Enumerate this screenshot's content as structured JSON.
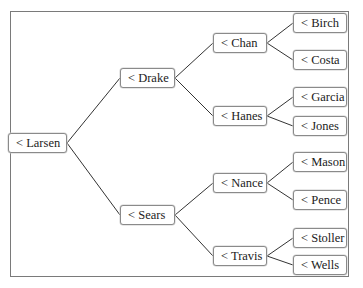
{
  "diagram": {
    "type": "tree",
    "orientation": "left-to-right",
    "root": "< Larsen",
    "nodes": {
      "larsen": {
        "label": "< Larsen",
        "x": 8,
        "y": 133,
        "w": 59
      },
      "drake": {
        "label": "< Drake",
        "x": 120,
        "y": 68,
        "w": 55
      },
      "sears": {
        "label": "< Sears",
        "x": 120,
        "y": 205,
        "w": 55
      },
      "chan": {
        "label": "< Chan",
        "x": 213,
        "y": 33,
        "w": 54
      },
      "hanes": {
        "label": "< Hanes",
        "x": 213,
        "y": 106,
        "w": 54
      },
      "nance": {
        "label": "< Nance",
        "x": 213,
        "y": 173,
        "w": 54
      },
      "travis": {
        "label": "< Travis",
        "x": 213,
        "y": 246,
        "w": 54
      },
      "birch": {
        "label": "< Birch",
        "x": 293,
        "y": 13,
        "w": 54
      },
      "costa": {
        "label": "< Costa",
        "x": 293,
        "y": 50,
        "w": 54
      },
      "garcia": {
        "label": "< Garcia",
        "x": 293,
        "y": 87,
        "w": 54
      },
      "jones": {
        "label": "< Jones",
        "x": 293,
        "y": 116,
        "w": 54
      },
      "mason": {
        "label": "< Mason",
        "x": 293,
        "y": 152,
        "w": 54
      },
      "pence": {
        "label": "< Pence",
        "x": 293,
        "y": 190,
        "w": 54
      },
      "stoller": {
        "label": "< Stoller",
        "x": 293,
        "y": 228,
        "w": 54
      },
      "wells": {
        "label": "< Wells",
        "x": 293,
        "y": 255,
        "w": 54
      }
    },
    "edges": [
      [
        "larsen",
        "drake"
      ],
      [
        "larsen",
        "sears"
      ],
      [
        "drake",
        "chan"
      ],
      [
        "drake",
        "hanes"
      ],
      [
        "sears",
        "nance"
      ],
      [
        "sears",
        "travis"
      ],
      [
        "chan",
        "birch"
      ],
      [
        "chan",
        "costa"
      ],
      [
        "hanes",
        "garcia"
      ],
      [
        "hanes",
        "jones"
      ],
      [
        "nance",
        "mason"
      ],
      [
        "nance",
        "pence"
      ],
      [
        "travis",
        "stoller"
      ],
      [
        "travis",
        "wells"
      ]
    ],
    "colors": {
      "line": "#333333",
      "border": "#8a8a8a",
      "frame": "#7a7a7a"
    }
  }
}
